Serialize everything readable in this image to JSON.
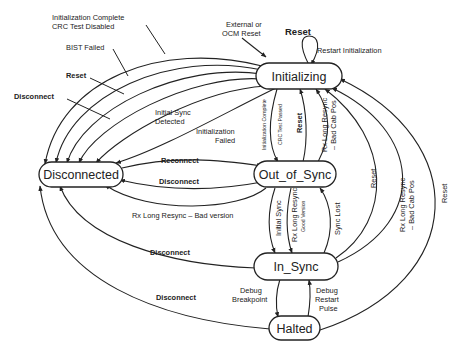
{
  "diagram": {
    "type": "state-machine",
    "states": {
      "initializing": "Initializing",
      "disconnected": "Disconnected",
      "out_of_sync": "Out_of_Sync",
      "in_sync": "In_Sync",
      "halted": "Halted"
    },
    "labels": {
      "init_complete_crc_disabled_1": "Initialization Complete",
      "init_complete_crc_disabled_2": "CRC Test Disabled",
      "bist_failed": "BIST Failed",
      "reset_top_left": "Reset",
      "disconnect_top_left": "Disconnect",
      "external_ocm_reset_1": "External or",
      "external_ocm_reset_2": "OCM Reset",
      "reset_self_loop": "Reset",
      "restart_initialization": "Restart Initialization",
      "initial_sync_detected_1": "Initial Sync",
      "initial_sync_detected_2": "Detected",
      "initialization_failed_1": "Initialization",
      "initialization_failed_2": "Failed",
      "init_complete_crc_passed_1": "Initialization Complete",
      "init_complete_crc_passed_2": "CRC Test Passed",
      "reset_oos_to_init": "Reset",
      "rx_long_resync_bad_cab_pos_1a": "Rx Long Resync",
      "rx_long_resync_bad_cab_pos_1b": "– Bad Cab Pos",
      "reconnect": "Reconnect",
      "disconnect_oos": "Disconnect",
      "rx_long_resync_bad_version": "Rx Long Resync – Bad version",
      "reset_insync_to_init": "Reset",
      "rx_long_resync_bad_cab_pos_2a": "Rx Long Resync",
      "rx_long_resync_bad_cab_pos_2b": "– Bad Cab Pos",
      "reset_halted_to_init": "Reset",
      "initial_sync": "Initial Sync",
      "rx_long_resync_good_1": "Rx Long Resync",
      "rx_long_resync_good_2": "Good Version",
      "sync_lost": "Sync Lost",
      "disconnect_insync": "Disconnect",
      "disconnect_halted": "Disconnect",
      "debug_breakpoint_1": "Debug",
      "debug_breakpoint_2": "Breakpoint",
      "debug_restart_1": "Debug",
      "debug_restart_2": "Restart",
      "debug_restart_3": "Pulse"
    },
    "transitions": [
      {
        "from": "Initializing",
        "to": "Initializing",
        "label": "Reset / Restart Initialization"
      },
      {
        "from": "External",
        "to": "Initializing",
        "label": "External or OCM Reset"
      },
      {
        "from": "Initializing",
        "to": "Disconnected",
        "label": "Initialization Complete CRC Test Disabled"
      },
      {
        "from": "Initializing",
        "to": "Disconnected",
        "label": "BIST Failed"
      },
      {
        "from": "Initializing",
        "to": "Disconnected",
        "label": "Reset"
      },
      {
        "from": "Initializing",
        "to": "Disconnected",
        "label": "Disconnect"
      },
      {
        "from": "Initializing",
        "to": "Disconnected",
        "label": "Initial Sync Detected"
      },
      {
        "from": "Initializing",
        "to": "Disconnected",
        "label": "Initialization Failed"
      },
      {
        "from": "Initializing",
        "to": "Out_of_Sync",
        "label": "Initialization Complete CRC Test Passed"
      },
      {
        "from": "Out_of_Sync",
        "to": "Initializing",
        "label": "Reset"
      },
      {
        "from": "Out_of_Sync",
        "to": "Initializing",
        "label": "Rx Long Resync - Bad Cab Pos"
      },
      {
        "from": "Disconnected",
        "to": "Out_of_Sync",
        "label": "Reconnect"
      },
      {
        "from": "Out_of_Sync",
        "to": "Disconnected",
        "label": "Disconnect"
      },
      {
        "from": "Out_of_Sync",
        "to": "Disconnected",
        "label": "Rx Long Resync - Bad version"
      },
      {
        "from": "Out_of_Sync",
        "to": "In_Sync",
        "label": "Initial Sync"
      },
      {
        "from": "Out_of_Sync",
        "to": "In_Sync",
        "label": "Rx Long Resync Good Version"
      },
      {
        "from": "In_Sync",
        "to": "Out_of_Sync",
        "label": "Sync Lost"
      },
      {
        "from": "In_Sync",
        "to": "Initializing",
        "label": "Reset"
      },
      {
        "from": "In_Sync",
        "to": "Initializing",
        "label": "Rx Long Resync - Bad Cab Pos"
      },
      {
        "from": "Halted",
        "to": "Initializing",
        "label": "Reset"
      },
      {
        "from": "In_Sync",
        "to": "Disconnected",
        "label": "Disconnect"
      },
      {
        "from": "Halted",
        "to": "Disconnected",
        "label": "Disconnect"
      },
      {
        "from": "In_Sync",
        "to": "Halted",
        "label": "Debug Breakpoint"
      },
      {
        "from": "Halted",
        "to": "In_Sync",
        "label": "Debug Restart Pulse"
      }
    ]
  }
}
